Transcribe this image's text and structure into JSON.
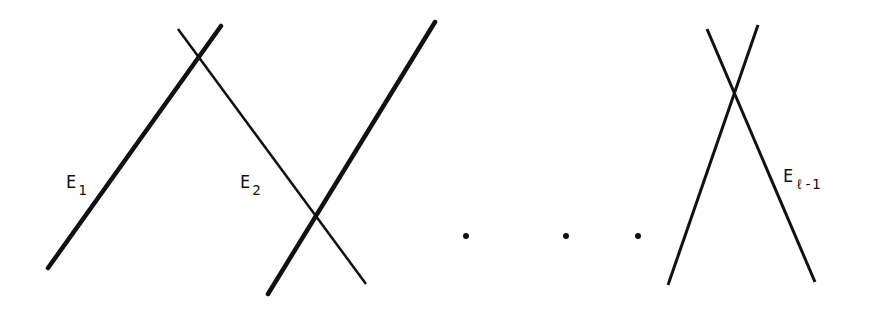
{
  "diagram": {
    "labels": {
      "e1": {
        "base": "E",
        "sub": "1"
      },
      "e2": {
        "base": "E",
        "sub": "2"
      },
      "el1": {
        "base": "E",
        "sub": "ℓ-1"
      }
    },
    "ellipsis": [
      "•",
      "•",
      "•"
    ],
    "line_color": "#111111"
  }
}
